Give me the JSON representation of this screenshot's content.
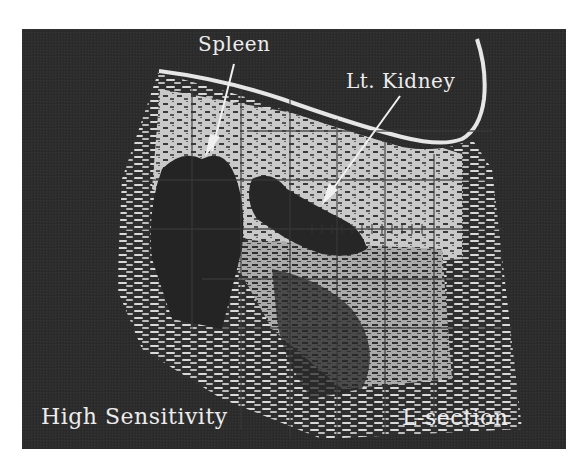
{
  "image": {
    "type": "B-mode ultrasound scan (grayscale print)",
    "annotations": {
      "spleen_label": "Spleen",
      "kidney_label": "Lt. Kidney",
      "sensitivity_label": "High Sensitivity",
      "section_label": "L-section"
    },
    "colors": {
      "background": "#2b2b2b",
      "tissue_bright": "#d4d4d4",
      "tissue_mid": "#9a9a9a",
      "text": "#ececec",
      "page": "#ffffff"
    },
    "grid": {
      "vertical_lines": 6,
      "horizontal_lines": 5
    }
  }
}
